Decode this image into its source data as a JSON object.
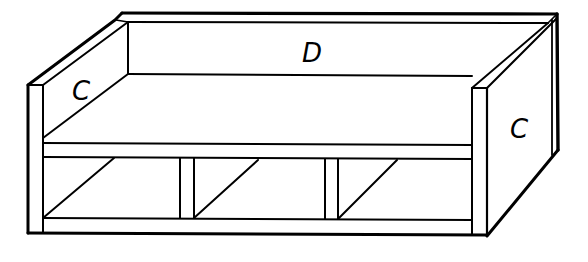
{
  "diagram": {
    "type": "furniture-assembly-line-drawing",
    "stroke_color": "#000000",
    "background_color": "#ffffff",
    "labels": {
      "left_side": "C",
      "back": "D",
      "right_side": "C"
    },
    "compartments": 3
  }
}
